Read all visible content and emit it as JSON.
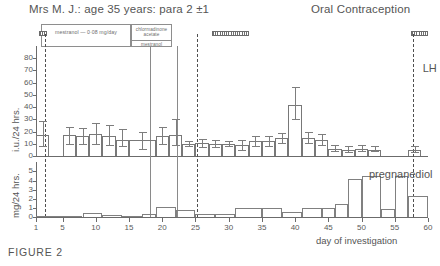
{
  "figure": {
    "caption": "FIGURE 2",
    "patient_title": "Mrs M. J.: age 35 years: para 2 ±1",
    "regimen_title": "Oral Contraception"
  },
  "treatments": [
    {
      "name": "mestranol-regimen",
      "label": "mestranol — 0·08 mg/day",
      "start_day": 2,
      "end_day": 18
    },
    {
      "name": "chlormadinone-mestranol-regimen",
      "label_line1": "chlormadinone",
      "label_line2": "acetate",
      "label_line3": "mestranol",
      "start_day": 18,
      "end_day": 25
    }
  ],
  "menses_markers": [
    {
      "name": "menses-marker-1",
      "start_day": 1.4,
      "end_day": 2.6
    },
    {
      "name": "menses-marker-2",
      "start_day": 27.5,
      "end_day": 33.0
    },
    {
      "name": "menses-marker-3",
      "start_day": 57.5,
      "end_day": 60.0
    }
  ],
  "event_lines": [
    {
      "name": "event-line-day2",
      "day": 2.3,
      "style": "dashed"
    },
    {
      "name": "event-line-day18",
      "day": 18.1,
      "style": "solid"
    },
    {
      "name": "event-line-day22",
      "day": 22.2,
      "style": "solid"
    },
    {
      "name": "event-line-day25",
      "day": 25.2,
      "style": "dashed"
    },
    {
      "name": "event-line-day57",
      "day": 57.8,
      "style": "dashed"
    }
  ],
  "annotations": [
    {
      "name": "lh-annotation",
      "text": "LH",
      "day": 58.6,
      "panel": "upper"
    },
    {
      "name": "pregnanediol-annotation",
      "text": "pregnanediol",
      "day": 50.5,
      "panel": "lower"
    }
  ],
  "chart_data": [
    {
      "type": "bar",
      "name": "urinary-gonadotrophin-panel",
      "title": "Mrs M. J.: age 35 years: para 2 ±1",
      "ylabel": "i.u./24 hrs.",
      "xlabel": "day of investigation",
      "ylim": [
        0,
        85
      ],
      "yticks": [
        0,
        10,
        20,
        30,
        40,
        50,
        60,
        70,
        80
      ],
      "xlim": [
        1,
        60
      ],
      "xticks": [
        1,
        5,
        10,
        15,
        20,
        25,
        30,
        35,
        40,
        45,
        50,
        55,
        60
      ],
      "grid": false,
      "legend": "none",
      "error_bars": true,
      "bars": [
        {
          "x_start": 1,
          "x_end": 3,
          "value": 17,
          "err_low": 8,
          "err_high": 29
        },
        {
          "x_start": 5,
          "x_end": 7,
          "value": 17,
          "err_low": 10,
          "err_high": 24
        },
        {
          "x_start": 7,
          "x_end": 9,
          "value": 16,
          "err_low": 10,
          "err_high": 23
        },
        {
          "x_start": 9,
          "x_end": 11,
          "value": 18,
          "err_low": 10,
          "err_high": 27
        },
        {
          "x_start": 11,
          "x_end": 13,
          "value": 16,
          "err_low": 9,
          "err_high": 25
        },
        {
          "x_start": 13,
          "x_end": 15,
          "value": 13,
          "err_low": 8,
          "err_high": 22
        },
        {
          "x_start": 15,
          "x_end": 19,
          "value": 13,
          "err_low": 6,
          "err_high": 20
        },
        {
          "x_start": 19,
          "x_end": 21,
          "value": 16,
          "err_low": 10,
          "err_high": 24
        },
        {
          "x_start": 21,
          "x_end": 23,
          "value": 17,
          "err_low": 9,
          "err_high": 30
        },
        {
          "x_start": 23,
          "x_end": 25,
          "value": 10,
          "err_low": 8,
          "err_high": 12
        },
        {
          "x_start": 25,
          "x_end": 27,
          "value": 11,
          "err_low": 7,
          "err_high": 14
        },
        {
          "x_start": 27,
          "x_end": 29,
          "value": 10,
          "err_low": 7,
          "err_high": 13
        },
        {
          "x_start": 29,
          "x_end": 31,
          "value": 10,
          "err_low": 8,
          "err_high": 12
        },
        {
          "x_start": 31,
          "x_end": 33,
          "value": 9,
          "err_low": 5,
          "err_high": 13
        },
        {
          "x_start": 33,
          "x_end": 35,
          "value": 12,
          "err_low": 8,
          "err_high": 16
        },
        {
          "x_start": 35,
          "x_end": 37,
          "value": 12,
          "err_low": 8,
          "err_high": 16
        },
        {
          "x_start": 37,
          "x_end": 39,
          "value": 15,
          "err_low": 11,
          "err_high": 19
        },
        {
          "x_start": 39,
          "x_end": 41,
          "value": 42,
          "err_low": 30,
          "err_high": 56
        },
        {
          "x_start": 41,
          "x_end": 43,
          "value": 15,
          "err_low": 11,
          "err_high": 20
        },
        {
          "x_start": 43,
          "x_end": 45,
          "value": 13,
          "err_low": 9,
          "err_high": 18
        },
        {
          "x_start": 45,
          "x_end": 47,
          "value": 6,
          "err_low": 4,
          "err_high": 9
        },
        {
          "x_start": 47,
          "x_end": 49,
          "value": 5,
          "err_low": 3,
          "err_high": 8
        },
        {
          "x_start": 49,
          "x_end": 51,
          "value": 6,
          "err_low": 4,
          "err_high": 9
        },
        {
          "x_start": 51,
          "x_end": 53,
          "value": 5,
          "err_low": 4,
          "err_high": 8
        },
        {
          "x_start": 57,
          "x_end": 59,
          "value": 5,
          "err_low": 3,
          "err_high": 8
        }
      ]
    },
    {
      "type": "bar",
      "name": "pregnanediol-panel",
      "ylabel": "mg/24 hrs.",
      "xlabel": "day of investigation",
      "ylim": [
        0,
        5.6
      ],
      "yticks": [
        0,
        1,
        2,
        3,
        4,
        5
      ],
      "xlim": [
        1,
        60
      ],
      "xticks": [
        1,
        5,
        10,
        15,
        20,
        25,
        30,
        35,
        40,
        45,
        50,
        55,
        60
      ],
      "grid": false,
      "legend": "pregnanediol",
      "error_bars": false,
      "bars": [
        {
          "x_start": 1,
          "x_end": 5,
          "value": 0.1
        },
        {
          "x_start": 5,
          "x_end": 8,
          "value": 0.15
        },
        {
          "x_start": 8,
          "x_end": 11,
          "value": 0.4
        },
        {
          "x_start": 11,
          "x_end": 14,
          "value": 0.25
        },
        {
          "x_start": 14,
          "x_end": 17,
          "value": 0.15
        },
        {
          "x_start": 17,
          "x_end": 19,
          "value": 0.3
        },
        {
          "x_start": 19,
          "x_end": 22,
          "value": 1.05
        },
        {
          "x_start": 22,
          "x_end": 25,
          "value": 0.8
        },
        {
          "x_start": 25,
          "x_end": 28,
          "value": 0.3
        },
        {
          "x_start": 28,
          "x_end": 31,
          "value": 0.35
        },
        {
          "x_start": 31,
          "x_end": 35,
          "value": 1.0
        },
        {
          "x_start": 35,
          "x_end": 38,
          "value": 0.95
        },
        {
          "x_start": 38,
          "x_end": 41,
          "value": 0.6
        },
        {
          "x_start": 41,
          "x_end": 44,
          "value": 0.95
        },
        {
          "x_start": 44,
          "x_end": 46,
          "value": 1.0
        },
        {
          "x_start": 46,
          "x_end": 48,
          "value": 1.45
        },
        {
          "x_start": 48,
          "x_end": 50,
          "value": 4.2
        },
        {
          "x_start": 50,
          "x_end": 53,
          "value": 4.45
        },
        {
          "x_start": 53,
          "x_end": 55,
          "value": 0.9
        },
        {
          "x_start": 55,
          "x_end": 57,
          "value": 4.45
        },
        {
          "x_start": 57,
          "x_end": 60,
          "value": 2.3
        }
      ]
    }
  ]
}
